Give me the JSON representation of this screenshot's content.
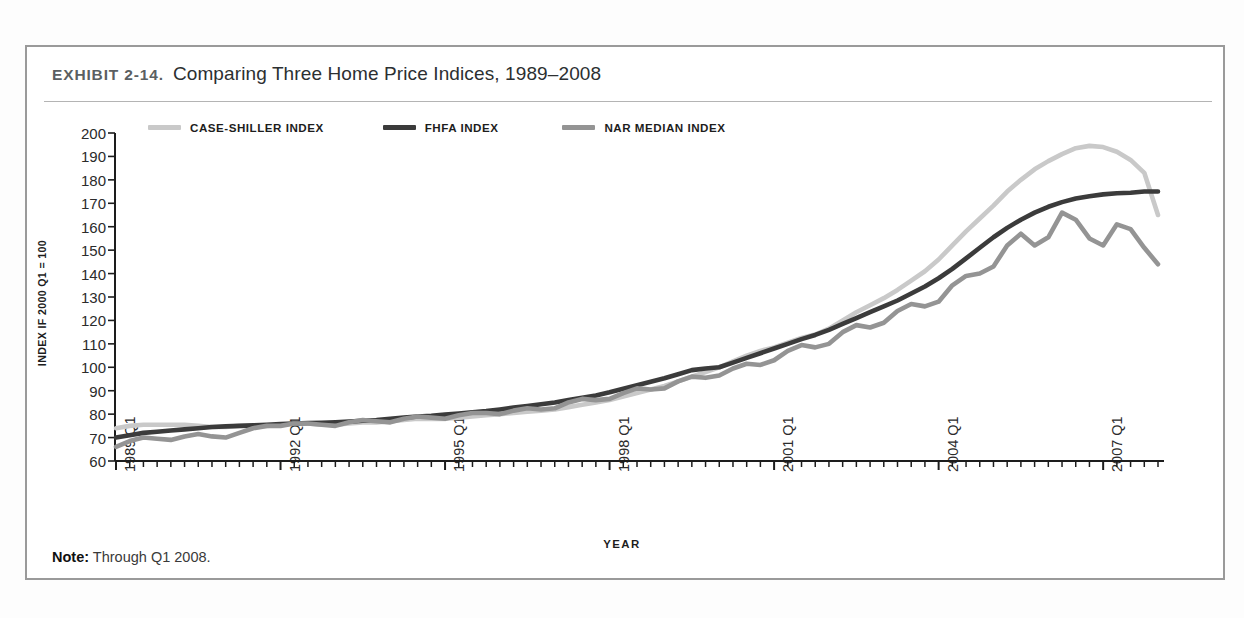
{
  "exhibit": {
    "tag": "EXHIBIT 2-14.",
    "title": "Comparing Three Home Price Indices, 1989–2008"
  },
  "note": {
    "label": "Note:",
    "text": "Through Q1 2008."
  },
  "colors": {
    "case_shiller": "#c9c9c9",
    "fhfa": "#3b3b3b",
    "nar": "#949494",
    "axis": "#1d1d1d",
    "frame": "#9a9a9a",
    "rule": "#b4b4b4"
  },
  "chart_data": {
    "type": "line",
    "title": "Comparing Three Home Price Indices, 1989–2008",
    "xlabel": "YEAR",
    "ylabel": "INDEX IF 2000 Q1 = 100",
    "ylim": [
      60,
      200
    ],
    "ytick_step": 10,
    "yticks": [
      200,
      190,
      180,
      170,
      160,
      150,
      140,
      130,
      120,
      110,
      100,
      90,
      80,
      70,
      60
    ],
    "grid": false,
    "legend_position": "top-left",
    "x_tick_labels": [
      "1989 Q1",
      "1992 Q1",
      "1995 Q1",
      "1998 Q1",
      "2001 Q1",
      "2004 Q1",
      "2007 Q1"
    ],
    "x_label_indices": [
      0,
      12,
      24,
      36,
      48,
      60,
      72
    ],
    "x_minor_ticks": "quarterly",
    "x": [
      "1989 Q1",
      "1989 Q2",
      "1989 Q3",
      "1989 Q4",
      "1990 Q1",
      "1990 Q2",
      "1990 Q3",
      "1990 Q4",
      "1991 Q1",
      "1991 Q2",
      "1991 Q3",
      "1991 Q4",
      "1992 Q1",
      "1992 Q2",
      "1992 Q3",
      "1992 Q4",
      "1993 Q1",
      "1993 Q2",
      "1993 Q3",
      "1993 Q4",
      "1994 Q1",
      "1994 Q2",
      "1994 Q3",
      "1994 Q4",
      "1995 Q1",
      "1995 Q2",
      "1995 Q3",
      "1995 Q4",
      "1996 Q1",
      "1996 Q2",
      "1996 Q3",
      "1996 Q4",
      "1997 Q1",
      "1997 Q2",
      "1997 Q3",
      "1997 Q4",
      "1998 Q1",
      "1998 Q2",
      "1998 Q3",
      "1998 Q4",
      "1999 Q1",
      "1999 Q2",
      "1999 Q3",
      "1999 Q4",
      "2000 Q1",
      "2000 Q2",
      "2000 Q3",
      "2000 Q4",
      "2001 Q1",
      "2001 Q2",
      "2001 Q3",
      "2001 Q4",
      "2002 Q1",
      "2002 Q2",
      "2002 Q3",
      "2002 Q4",
      "2003 Q1",
      "2003 Q2",
      "2003 Q3",
      "2003 Q4",
      "2004 Q1",
      "2004 Q2",
      "2004 Q3",
      "2004 Q4",
      "2005 Q1",
      "2005 Q2",
      "2005 Q3",
      "2005 Q4",
      "2006 Q1",
      "2006 Q2",
      "2006 Q3",
      "2006 Q4",
      "2007 Q1",
      "2007 Q2",
      "2007 Q3",
      "2007 Q4",
      "2008 Q1"
    ],
    "series": [
      {
        "name": "CASE-SHILLER INDEX",
        "color": "#c9c9c9",
        "values": [
          74.0,
          75.0,
          75.5,
          75.5,
          75.5,
          75.5,
          75.0,
          74.5,
          74.5,
          75.0,
          75.0,
          75.0,
          75.5,
          76.0,
          76.0,
          75.5,
          75.5,
          76.0,
          76.5,
          76.5,
          77.0,
          77.5,
          78.0,
          78.0,
          78.0,
          78.5,
          79.0,
          79.5,
          80.0,
          80.5,
          81.0,
          81.5,
          82.0,
          83.0,
          84.0,
          85.0,
          86.0,
          87.5,
          89.0,
          90.5,
          92.0,
          94.0,
          96.0,
          98.0,
          100.0,
          102.5,
          105.0,
          107.0,
          108.5,
          110.5,
          112.5,
          114.0,
          116.5,
          120.0,
          123.5,
          126.5,
          129.5,
          133.0,
          137.0,
          141.0,
          146.0,
          152.0,
          158.0,
          163.5,
          169.0,
          175.0,
          180.0,
          184.5,
          188.0,
          191.0,
          193.5,
          194.5,
          194.0,
          192.0,
          188.5,
          183.0,
          165.0
        ]
      },
      {
        "name": "FHFA INDEX",
        "color": "#3b3b3b",
        "values": [
          70.0,
          71.0,
          72.0,
          72.5,
          73.0,
          73.5,
          74.0,
          74.5,
          74.8,
          75.0,
          75.2,
          75.5,
          75.8,
          76.0,
          76.2,
          76.3,
          76.5,
          76.8,
          77.2,
          77.5,
          78.0,
          78.5,
          79.0,
          79.3,
          79.8,
          80.3,
          80.8,
          81.3,
          82.0,
          82.8,
          83.5,
          84.2,
          85.0,
          86.0,
          87.0,
          88.0,
          89.3,
          90.8,
          92.3,
          93.8,
          95.3,
          97.0,
          98.8,
          99.5,
          100.0,
          102.0,
          104.0,
          106.0,
          108.0,
          110.0,
          112.0,
          113.8,
          116.0,
          118.5,
          121.0,
          123.5,
          126.0,
          128.5,
          131.5,
          134.5,
          138.0,
          142.0,
          146.5,
          151.0,
          155.5,
          159.5,
          163.0,
          166.0,
          168.5,
          170.5,
          172.0,
          173.0,
          173.8,
          174.3,
          174.5,
          175.0,
          175.0
        ]
      },
      {
        "name": "NAR MEDIAN INDEX",
        "color": "#949494",
        "values": [
          66.0,
          68.5,
          70.0,
          69.5,
          69.0,
          70.5,
          71.5,
          70.5,
          70.0,
          72.0,
          74.0,
          75.0,
          75.0,
          76.0,
          76.0,
          75.5,
          75.0,
          76.5,
          77.5,
          77.0,
          76.5,
          78.0,
          79.0,
          78.5,
          78.0,
          79.5,
          80.5,
          80.5,
          80.0,
          81.5,
          82.5,
          82.0,
          82.5,
          85.0,
          86.5,
          86.0,
          86.5,
          89.0,
          91.0,
          90.5,
          91.0,
          94.0,
          96.0,
          95.5,
          96.5,
          99.5,
          101.5,
          101.0,
          103.0,
          107.0,
          109.5,
          108.5,
          110.0,
          115.0,
          118.0,
          117.0,
          119.0,
          124.0,
          127.0,
          126.0,
          128.0,
          135.0,
          139.0,
          140.0,
          143.0,
          152.0,
          157.0,
          152.0,
          155.5,
          166.0,
          163.0,
          155.0,
          152.0,
          161.0,
          159.0,
          151.0,
          144.0
        ]
      }
    ],
    "plot_area": {
      "left": 116,
      "right": 1158,
      "top": 133,
      "bottom": 461
    }
  }
}
